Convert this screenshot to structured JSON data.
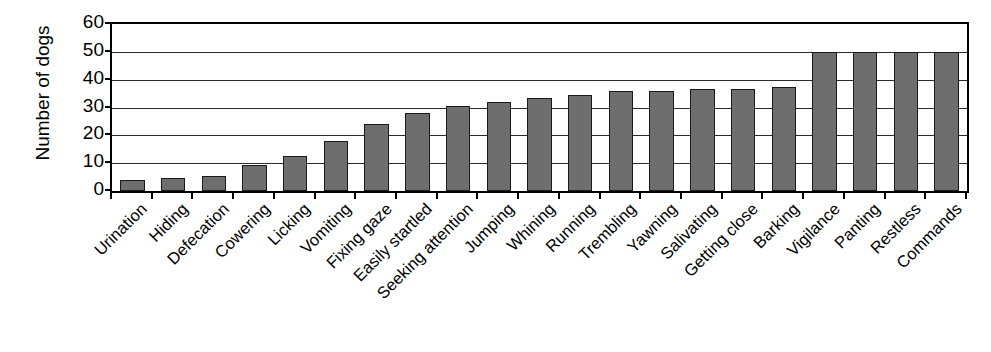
{
  "chart_data": {
    "type": "bar",
    "title": "",
    "xlabel": "",
    "ylabel": "Number of dogs",
    "ylim": [
      0,
      60
    ],
    "ytick_values": [
      0,
      10,
      20,
      30,
      40,
      50,
      60
    ],
    "ytick_labels": [
      "0",
      "10",
      "20",
      "30",
      "40",
      "50",
      "60"
    ],
    "grid": true,
    "legend": "none",
    "bar_color": "#6e6e6e",
    "bar_edge_color": "#1a1a1a",
    "axis_color": "#000000",
    "background_color": "#ffffff",
    "categories": [
      "Urination",
      "Hiding",
      "Defecation",
      "Cowering",
      "Licking",
      "Vomiting",
      "Fixing gaze",
      "Easily startled",
      "Seeking attention",
      "Jumping",
      "Whining",
      "Running",
      "Trembling",
      "Yawning",
      "Salivating",
      "Getting close",
      "Barking",
      "Vigilance",
      "Panting",
      "Restless",
      "Commands"
    ],
    "values": [
      4,
      4.5,
      5.5,
      9.5,
      12.5,
      18,
      24,
      28,
      30.5,
      32,
      33.5,
      34.5,
      36,
      36,
      36.5,
      36.5,
      37.5,
      50,
      50,
      50,
      50
    ]
  }
}
